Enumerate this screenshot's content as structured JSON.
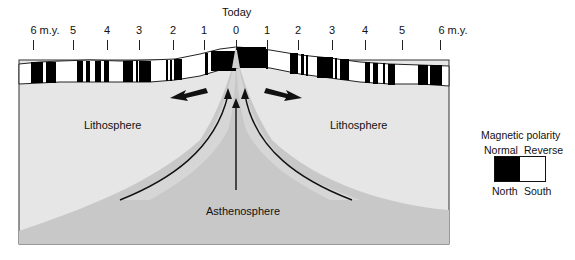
{
  "title": "Today",
  "timescale": {
    "left": [
      {
        "label": "6 m.y.",
        "x": 33
      },
      {
        "label": "5",
        "x": 73
      },
      {
        "label": "4",
        "x": 107
      },
      {
        "label": "3",
        "x": 139
      },
      {
        "label": "2",
        "x": 173
      },
      {
        "label": "1",
        "x": 204
      },
      {
        "label": "0",
        "x": 236
      }
    ],
    "right": [
      {
        "label": "1",
        "x": 267
      },
      {
        "label": "2",
        "x": 298
      },
      {
        "label": "3",
        "x": 332
      },
      {
        "label": "4",
        "x": 365
      },
      {
        "label": "5",
        "x": 402
      },
      {
        "label": "6 m.y.",
        "x": 440
      }
    ]
  },
  "labels": {
    "lithosphere_left": "Lithosphere",
    "lithosphere_right": "Lithosphere",
    "asthenosphere": "Asthenosphere"
  },
  "legend": {
    "title": "Magnetic polarity",
    "normal": "Normal",
    "reverse": "Reverse",
    "north": "North",
    "south": "South",
    "normal_color": "#000000",
    "reverse_color": "#ffffff"
  },
  "colors": {
    "lithosphere": "#e6e6e6",
    "asthenosphere": "#c4c4c4",
    "ridge_band": "#d2d2d2"
  }
}
